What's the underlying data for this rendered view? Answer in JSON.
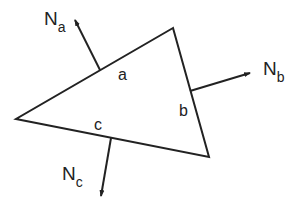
{
  "diagram": {
    "title": "",
    "stroke_color": "#222222",
    "background": "#ffffff",
    "triangle": {
      "vertices": {
        "top": [
          173,
          28
        ],
        "left": [
          16,
          119
        ],
        "bottom_right": [
          209,
          157
        ]
      }
    },
    "sides": [
      {
        "id": "a",
        "label": "a"
      },
      {
        "id": "b",
        "label": "b"
      },
      {
        "id": "c",
        "label": "c"
      }
    ],
    "normals": [
      {
        "id": "Na",
        "main": "N",
        "sub": "a",
        "from": [
          100,
          70
        ],
        "to": [
          74,
          18
        ]
      },
      {
        "id": "Nb",
        "main": "N",
        "sub": "b",
        "from": [
          190,
          91
        ],
        "to": [
          252,
          73
        ]
      },
      {
        "id": "Nc",
        "main": "N",
        "sub": "c",
        "from": [
          111,
          138
        ],
        "to": [
          100,
          198
        ]
      }
    ]
  }
}
